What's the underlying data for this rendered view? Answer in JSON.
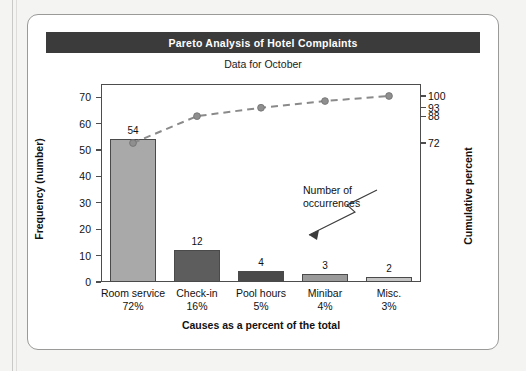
{
  "card": {
    "title": "Pareto Analysis of Hotel Complaints",
    "subtitle": "Data for October"
  },
  "annotation": {
    "line1": "Number of",
    "line2": "occurrences"
  },
  "colors": {
    "banner_bg": "#3b3b3b",
    "banner_text": "#ffffff",
    "axis": "#4d4d4d",
    "line": "#8a8a8a",
    "bar1": "#a9a9a9",
    "bar2": "#5d5d5d",
    "bar3": "#4a4a4a",
    "bar4": "#9a9a9a",
    "bar5": "#c4c4c4"
  },
  "chart_data": {
    "type": "bar",
    "title": "Pareto Analysis of Hotel Complaints",
    "subtitle": "Data for October",
    "xlabel": "Causes as a percent of the total",
    "ylabel": "Frequency (number)",
    "ylabel_secondary": "Cumulative percent",
    "categories": [
      "Room service",
      "Check-in",
      "Pool hours",
      "Minibar",
      "Misc."
    ],
    "category_percents": [
      "72%",
      "16%",
      "5%",
      "4%",
      "3%"
    ],
    "values": [
      54,
      12,
      4,
      3,
      2
    ],
    "bar_colors": [
      "#a9a9a9",
      "#5d5d5d",
      "#4a4a4a",
      "#9a9a9a",
      "#c4c4c4"
    ],
    "cumulative_percent": [
      72,
      88,
      93,
      97,
      100
    ],
    "ylim": [
      0,
      75
    ],
    "yticks": [
      0,
      10,
      20,
      30,
      40,
      50,
      60,
      70
    ],
    "ylim_secondary": [
      0,
      100
    ],
    "yticks_secondary": [
      72,
      88,
      93,
      100
    ],
    "grid": false,
    "legend": "none",
    "annotations": [
      {
        "text": "Number of occurrences",
        "points_to": "Check-in bar (value 12)"
      }
    ]
  }
}
